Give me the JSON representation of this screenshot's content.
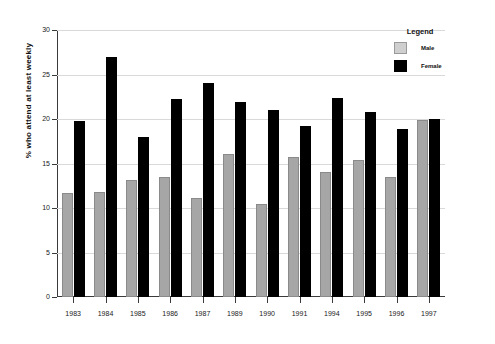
{
  "chart_data": {
    "type": "bar",
    "title": "",
    "subtitle": "",
    "xlabel": "",
    "ylabel": "% who attend at least weekly",
    "ylim": [
      0,
      30
    ],
    "yticks": [
      0,
      5,
      10,
      15,
      20,
      25,
      30
    ],
    "ytick_labels": [
      "0",
      "5",
      "10",
      "15",
      "20",
      "25",
      "30"
    ],
    "grid": true,
    "grid_axis": "y",
    "legend": {
      "title": "Legend",
      "position": "top-right",
      "entries": [
        {
          "label": "Male",
          "color": "#cfcfcf"
        },
        {
          "label": "Female",
          "color": "#000000"
        }
      ]
    },
    "categories": [
      "1983",
      "1984",
      "1985",
      "1986",
      "1987",
      "1989",
      "1990",
      "1991",
      "1994",
      "1995",
      "1996",
      "1997"
    ],
    "series": [
      {
        "name": "Male",
        "color": "#a6a6a6",
        "values": [
          11.7,
          11.8,
          13.1,
          13.5,
          11.1,
          16.1,
          10.4,
          15.7,
          14.0,
          15.4,
          13.5,
          19.9
        ]
      },
      {
        "name": "Female",
        "color": "#000000",
        "values": [
          19.8,
          27.0,
          18.0,
          22.2,
          24.0,
          21.9,
          21.0,
          19.2,
          22.4,
          20.8,
          18.9,
          20.0
        ]
      }
    ]
  }
}
